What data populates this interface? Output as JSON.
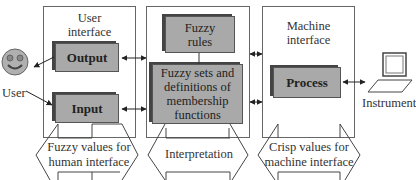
{
  "diagram": {
    "type": "fuzzy-logic-system-architecture",
    "panels": [
      {
        "id": "user-interface",
        "title_line1": "User",
        "title_line2": "interface"
      },
      {
        "id": "interpretation-panel",
        "title_line1": "",
        "title_line2": ""
      },
      {
        "id": "machine-interface",
        "title_line1": "Machine",
        "title_line2": "interface"
      }
    ],
    "boxes": {
      "output": "Output",
      "input": "Input",
      "fuzzy_rules_line1": "Fuzzy",
      "fuzzy_rules_line2": "rules",
      "fuzzy_sets_line1": "Fuzzy sets and",
      "fuzzy_sets_line2": "definitions of",
      "fuzzy_sets_line3": "membership",
      "fuzzy_sets_line4": "functions",
      "process": "Process"
    },
    "external": {
      "user": "User",
      "instrument": "Instrument"
    },
    "bottom_arrows": {
      "left_line1": "Fuzzy values for",
      "left_line2": "human interface",
      "middle": "Interpretation",
      "right_line1": "Crisp values for",
      "right_line2": "machine interface"
    },
    "colors": {
      "box_fill": "#a9a9a9",
      "box_shadow": "#444444",
      "border": "#666666",
      "smiley_fill": "#b0b0b0"
    }
  }
}
